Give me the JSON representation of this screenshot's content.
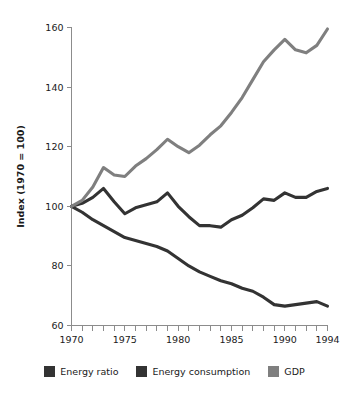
{
  "chart_data": {
    "type": "line",
    "title": "",
    "xlabel": "",
    "ylabel": "Index (1970 = 100)",
    "xlim": [
      1970,
      1994
    ],
    "ylim": [
      60,
      160
    ],
    "grid": false,
    "legend_position": "bottom",
    "x": [
      1970,
      1971,
      1972,
      1973,
      1974,
      1975,
      1976,
      1977,
      1978,
      1979,
      1980,
      1981,
      1982,
      1983,
      1984,
      1985,
      1986,
      1987,
      1988,
      1989,
      1990,
      1991,
      1992,
      1993,
      1994
    ],
    "y_ticks": [
      60,
      80,
      100,
      120,
      140,
      160
    ],
    "x_ticks": [
      1970,
      1971,
      1972,
      1973,
      1974,
      1975,
      1976,
      1977,
      1978,
      1979,
      1980,
      1981,
      1982,
      1983,
      1984,
      1985,
      1986,
      1987,
      1988,
      1989,
      1990,
      1991,
      1992,
      1993,
      1994
    ],
    "x_tick_labels": [
      "1970",
      "",
      "",
      "",
      "",
      "1975",
      "",
      "",
      "",
      "",
      "1980",
      "",
      "",
      "",
      "",
      "1985",
      "",
      "",
      "",
      "",
      "1990",
      "",
      "",
      "",
      "1994"
    ],
    "y_tick_labels": [
      "60",
      "80",
      "100",
      "120",
      "140",
      "160"
    ],
    "series": [
      {
        "name": "Energy ratio",
        "color": "#333333",
        "values": [
          100.0,
          98.0,
          95.5,
          93.5,
          91.5,
          89.5,
          88.5,
          87.5,
          86.5,
          85.0,
          82.5,
          80.0,
          78.0,
          76.5,
          75.0,
          74.0,
          72.5,
          71.5,
          69.5,
          67.0,
          66.5,
          67.0,
          67.5,
          68.0,
          66.5
        ]
      },
      {
        "name": "Energy consumption",
        "color": "#333333",
        "values": [
          100.0,
          101.0,
          103.0,
          106.0,
          101.5,
          97.5,
          99.5,
          100.5,
          101.5,
          104.5,
          100.0,
          96.5,
          93.5,
          93.5,
          93.0,
          95.5,
          97.0,
          99.5,
          102.5,
          102.0,
          104.5,
          103.0,
          103.0,
          105.0,
          106.0
        ]
      },
      {
        "name": "GDP",
        "color": "#7f7f7f",
        "values": [
          100.0,
          102.0,
          106.5,
          113.0,
          110.5,
          110.0,
          113.5,
          116.0,
          119.0,
          122.5,
          120.0,
          118.0,
          120.5,
          124.0,
          127.0,
          131.5,
          136.5,
          142.5,
          148.5,
          152.5,
          156.0,
          152.5,
          151.5,
          154.0,
          159.5
        ]
      }
    ]
  },
  "legend": {
    "items": [
      {
        "label": "Energy ratio",
        "color": "#333333"
      },
      {
        "label": "Energy consumption",
        "color": "#333333"
      },
      {
        "label": "GDP",
        "color": "#7f7f7f"
      }
    ]
  }
}
